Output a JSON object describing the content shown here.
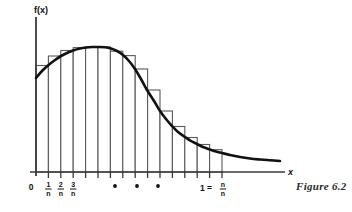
{
  "figure": {
    "caption": "Figure 6.2",
    "axis_labels": {
      "y": "f(x)",
      "x": "x"
    },
    "origin_label": "0",
    "ellipsis_dots": 3,
    "colors": {
      "curve": "#111111",
      "axis": "#3a3a3a",
      "rectangle_stroke": "#5a5a5a",
      "background": "#ffffff",
      "text": "#111111",
      "caption": "#2a2a2a"
    },
    "ticks": [
      {
        "id": "tick-0",
        "x": 36.0,
        "label": "0",
        "type": "integer"
      },
      {
        "id": "tick-1n",
        "x": 48.4,
        "label_num": "1",
        "label_den": "n",
        "type": "fraction"
      },
      {
        "id": "tick-2n",
        "x": 60.8,
        "label_num": "2",
        "label_den": "n",
        "type": "fraction"
      },
      {
        "id": "tick-3n",
        "x": 73.2,
        "label_num": "3",
        "label_den": "n",
        "type": "fraction"
      },
      {
        "id": "tick-4n",
        "x": 85.6,
        "type": "unlabeled"
      },
      {
        "id": "tick-5n",
        "x": 98.0,
        "type": "unlabeled"
      },
      {
        "id": "tick-6n",
        "x": 110.4,
        "type": "unlabeled"
      },
      {
        "id": "tick-7n",
        "x": 122.8,
        "type": "unlabeled"
      },
      {
        "id": "tick-8n",
        "x": 135.2,
        "type": "unlabeled"
      },
      {
        "id": "tick-9n",
        "x": 147.6,
        "type": "unlabeled"
      },
      {
        "id": "tick-10n",
        "x": 160.0,
        "type": "unlabeled"
      },
      {
        "id": "tick-11n",
        "x": 172.4,
        "type": "unlabeled"
      },
      {
        "id": "tick-12n",
        "x": 184.8,
        "type": "unlabeled"
      },
      {
        "id": "tick-13n",
        "x": 197.2,
        "type": "unlabeled"
      },
      {
        "id": "tick-14n",
        "x": 209.6,
        "type": "unlabeled"
      },
      {
        "id": "tick-nn",
        "x": 222.0,
        "label_eq": "1 =",
        "label_num": "n",
        "label_den": "n",
        "type": "fraction-equals"
      }
    ],
    "dots_x": [
      115,
      137,
      158
    ],
    "dots_y": 186
  },
  "chart_data": {
    "type": "area",
    "title": "",
    "xlabel": "x",
    "ylabel": "f(x)",
    "xlim": [
      0,
      1
    ],
    "x_axis_pixel": {
      "origin": 36,
      "end": 285,
      "baseline_y": 172
    },
    "y_axis_pixel": {
      "top": 17,
      "x": 36
    },
    "partition_count": 15,
    "partition_width_label": "1/n",
    "curve_points": [
      [
        36,
        78
      ],
      [
        42,
        71
      ],
      [
        48,
        65.5
      ],
      [
        55,
        60
      ],
      [
        61,
        56
      ],
      [
        68,
        52.5
      ],
      [
        73,
        50.5
      ],
      [
        80,
        48.5
      ],
      [
        86,
        47.5
      ],
      [
        92,
        47
      ],
      [
        98,
        47
      ],
      [
        105,
        47.3
      ],
      [
        111,
        48.5
      ],
      [
        117,
        51
      ],
      [
        123,
        55
      ],
      [
        129,
        61
      ],
      [
        135,
        69
      ],
      [
        141,
        79
      ],
      [
        147,
        90
      ],
      [
        154,
        101
      ],
      [
        160,
        111
      ],
      [
        166,
        119
      ],
      [
        172,
        126
      ],
      [
        178,
        132
      ],
      [
        185,
        137
      ],
      [
        191,
        141
      ],
      [
        197,
        144
      ],
      [
        203,
        147
      ],
      [
        210,
        149.5
      ],
      [
        216,
        151.5
      ],
      [
        222,
        153
      ],
      [
        230,
        155
      ],
      [
        240,
        157
      ],
      [
        250,
        158.5
      ],
      [
        260,
        159.5
      ],
      [
        270,
        160.3
      ],
      [
        280,
        161
      ]
    ],
    "rectangles": [
      {
        "x0": 36.0,
        "x1": 48.4,
        "top": 65.5
      },
      {
        "x0": 48.4,
        "x1": 60.8,
        "top": 56.0
      },
      {
        "x0": 60.8,
        "x1": 73.2,
        "top": 50.5
      },
      {
        "x0": 73.2,
        "x1": 85.6,
        "top": 47.6
      },
      {
        "x0": 85.6,
        "x1": 98.0,
        "top": 47.0
      },
      {
        "x0": 98.0,
        "x1": 110.4,
        "top": 47.0
      },
      {
        "x0": 110.4,
        "x1": 122.8,
        "top": 51.2
      },
      {
        "x0": 122.8,
        "x1": 135.2,
        "top": 55.6
      },
      {
        "x0": 135.2,
        "x1": 147.6,
        "top": 69.0
      },
      {
        "x0": 147.6,
        "x1": 160.0,
        "top": 90.0
      },
      {
        "x0": 160.0,
        "x1": 172.4,
        "top": 111.0
      },
      {
        "x0": 172.4,
        "x1": 184.8,
        "top": 126.5
      },
      {
        "x0": 184.8,
        "x1": 197.2,
        "top": 137.5
      },
      {
        "x0": 197.2,
        "x1": 209.6,
        "top": 144.5
      },
      {
        "x0": 209.6,
        "x1": 222.0,
        "top": 149.7
      }
    ],
    "legend": [],
    "grid": false
  }
}
